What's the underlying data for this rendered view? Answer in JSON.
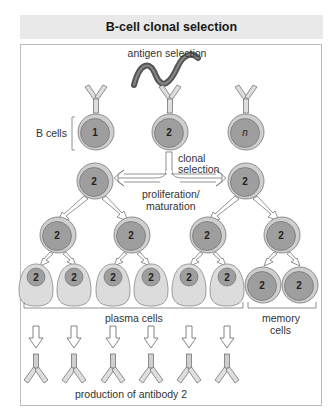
{
  "title": "B-cell clonal selection",
  "labels": {
    "antigen_selection": "antigen selection",
    "b_cells": "B cells",
    "clonal": "clonal",
    "selection": "selection",
    "proliferation": "proliferation/",
    "maturation": "maturation",
    "plasma_cells": "plasma cells",
    "memory": "memory",
    "cells": "cells",
    "production": "production of antibody 2"
  },
  "b_cells": [
    {
      "id": "1"
    },
    {
      "id": "2"
    },
    {
      "id": "n"
    }
  ],
  "clone_id": "2",
  "colors": {
    "cell_outer": "#c8c8c8",
    "cell_nucleus": "#9a9a9a",
    "plasma_body": "#dcdcdc",
    "antigen": "#555555",
    "outline": "#666666"
  }
}
